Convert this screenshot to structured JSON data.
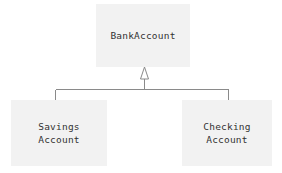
{
  "diagram": {
    "type": "uml-class-diagram",
    "background_color": "#ffffff",
    "box_fill_color": "#f2f2f2",
    "text_color": "#333333",
    "line_color": "#888888",
    "classes": [
      {
        "id": "bankaccount",
        "name": "BankAccount",
        "role": "superclass",
        "x": 96,
        "y": 4,
        "width": 94,
        "height": 63
      },
      {
        "id": "savingsaccount",
        "name": "Savings\nAccount",
        "role": "subclass",
        "x": 11,
        "y": 100,
        "width": 96,
        "height": 66
      },
      {
        "id": "checkingaccount",
        "name": "Checking\nAccount",
        "role": "subclass",
        "x": 182,
        "y": 100,
        "width": 90,
        "height": 66
      }
    ],
    "relationships": [
      {
        "type": "generalization",
        "label": "inheritance",
        "from": [
          "savingsaccount",
          "checkingaccount"
        ],
        "to": "bankaccount",
        "arrow": "hollow-triangle"
      }
    ]
  }
}
